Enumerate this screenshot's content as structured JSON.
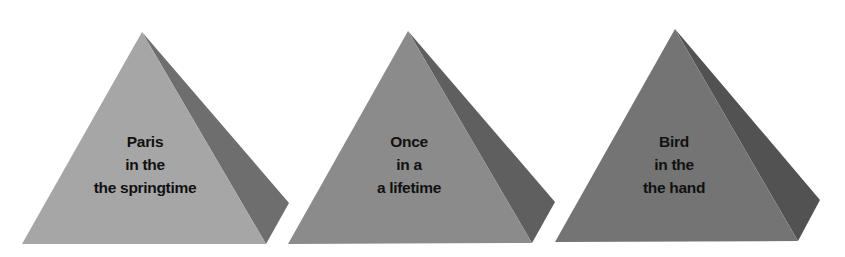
{
  "diagram": {
    "type": "three-pyramids",
    "pyramids": [
      {
        "lines": [
          "Paris",
          "in the",
          "the springtime"
        ],
        "front_color": "#a6a6a6",
        "side_color": "#6e6e6e"
      },
      {
        "lines": [
          "Once",
          "in a",
          "a lifetime"
        ],
        "front_color": "#8b8b8b",
        "side_color": "#5f5f5f"
      },
      {
        "lines": [
          "Bird",
          "in the",
          "the hand"
        ],
        "front_color": "#747474",
        "side_color": "#525252"
      }
    ]
  }
}
